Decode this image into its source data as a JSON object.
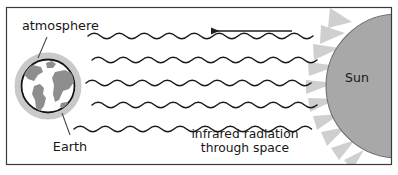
{
  "figure": {
    "frame": {
      "border_color": "#3a3a3a",
      "background_color": "#ffffff"
    }
  },
  "labels": {
    "atmosphere": "atmosphere",
    "earth": "Earth",
    "sun": "Sun",
    "radiation_line1": "infrared radiation",
    "radiation_line2": "through space"
  },
  "colors": {
    "ink": "#171717",
    "wave_stroke": "#1a1a1a",
    "arrow": "#1d1d1d",
    "sun_body": "#a8a8a8",
    "sun_outline": "#6f6f6f",
    "sun_rays": "#cfcfcf",
    "atmosphere_halo": "#c9c9c9",
    "earth_ocean": "#ffffff",
    "earth_land": "#8e8e8e",
    "earth_outline": "#141414",
    "leader_line": "#4a4a4a",
    "frame_border": "#3a3a3a"
  },
  "elements": {
    "earth": {
      "name": "Earth",
      "center_x": 48,
      "center_y": 86,
      "radius": 27,
      "halo_radius": 33,
      "has_atmosphere_halo": true,
      "continents_visible": [
        "North America",
        "South America",
        "Africa",
        "Europe"
      ]
    },
    "sun": {
      "name": "Sun",
      "shape": "semicircle at right edge",
      "center_x": 398,
      "center_y": 86,
      "radius": 72,
      "has_rays": true,
      "ray_count": 13
    },
    "arrow": {
      "name": "direction of radiation travel",
      "direction": "left",
      "from_x": 292,
      "to_x": 208,
      "y": 31,
      "meaning": "radiation travels from the Sun toward the Earth"
    },
    "waves": {
      "name": "infrared radiation wavy rays",
      "count": 5,
      "orientation": "horizontal",
      "x_start": 88,
      "x_end": 316,
      "y_centers": [
        38,
        61,
        84,
        106,
        129
      ],
      "wavelength": 25,
      "amplitude": 4.6
    }
  }
}
